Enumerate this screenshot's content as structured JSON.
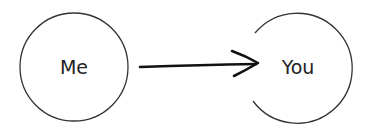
{
  "diagram": {
    "nodes": [
      {
        "id": "me",
        "label": "Me"
      },
      {
        "id": "you",
        "label": "You"
      }
    ],
    "edges": [
      {
        "from": "me",
        "to": "you"
      }
    ],
    "colors": {
      "stroke": "#333333",
      "arrow": "#111111",
      "background": "#ffffff"
    }
  }
}
